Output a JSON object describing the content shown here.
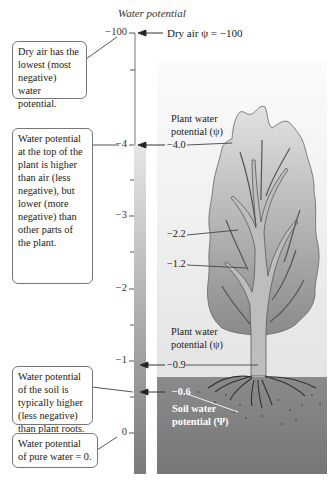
{
  "axis": {
    "title": "Water potential",
    "ticks": [
      {
        "label": "−100",
        "y": 33
      },
      {
        "label": "−4",
        "y": 145
      },
      {
        "label": "−3",
        "y": 216
      },
      {
        "label": "−2",
        "y": 289
      },
      {
        "label": "−1",
        "y": 361
      },
      {
        "label": "0",
        "y": 433
      }
    ]
  },
  "pointers": {
    "dry_air": "Dry air ψ = −100",
    "plant_top_title": "Plant water potential (ψ)",
    "plant_top_value": "−4.0",
    "branch_value_1": "−2.2",
    "branch_value_2": "−1.2",
    "plant_base_title": "Plant water potential (ψ)",
    "plant_base_value": "−0.9",
    "soil_value": "−0.6",
    "soil_title": "Soil water potential (Ψ)"
  },
  "callouts": {
    "dry_air": "Dry air has the lowest (most negative) water potential.",
    "plant_top": "Water potential at the top of the plant is higher than air (less negative), but lower (more negative) than other parts of the plant.",
    "soil": "Water potential of the soil is typically higher (less negative) than plant roots.",
    "pure_water": "Water potential of pure water = 0."
  },
  "colors": {
    "sky_top": "#f7f7f7",
    "sky_bottom": "#e6e6e6",
    "soil": "#7f7f7f",
    "leaf_light": "#dcdcdc",
    "leaf_dark": "#8c8c8c",
    "trunk": "#b4b4b4",
    "scale_top": "#e4e4e4",
    "scale_bottom": "#7a7a7a"
  }
}
